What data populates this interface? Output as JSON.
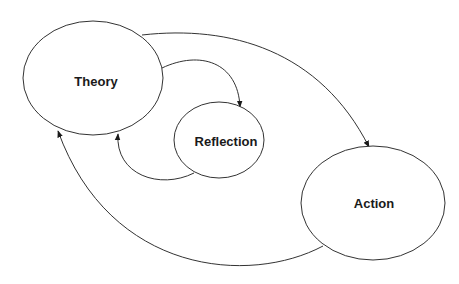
{
  "diagram": {
    "type": "cycle",
    "nodes": [
      {
        "id": "theory",
        "label": "Theory"
      },
      {
        "id": "reflection",
        "label": "Reflection"
      },
      {
        "id": "action",
        "label": "Action"
      }
    ],
    "edges": [
      {
        "from": "theory",
        "to": "reflection"
      },
      {
        "from": "reflection",
        "to": "theory"
      },
      {
        "from": "theory",
        "to": "action"
      },
      {
        "from": "action",
        "to": "theory"
      }
    ],
    "colors": {
      "stroke": "#333333",
      "text": "#1a1a1a",
      "background": "#ffffff"
    }
  }
}
